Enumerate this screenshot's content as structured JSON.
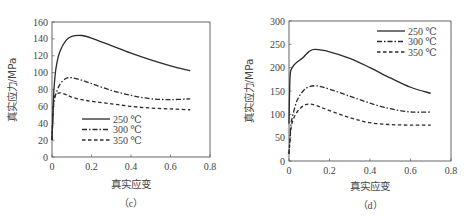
{
  "chart_data": [
    {
      "id": "c",
      "type": "line",
      "caption": "（c）",
      "xlabel": "真实应变",
      "ylabel": "真实应力/MPa",
      "xlim": [
        0,
        0.8
      ],
      "ylim": [
        0,
        160
      ],
      "xticks": [
        "0",
        "0.2",
        "0.4",
        "0.6",
        "0.8"
      ],
      "yticks": [
        "0",
        "20",
        "40",
        "60",
        "80",
        "100",
        "120",
        "140",
        "160"
      ],
      "grid": false,
      "legend_position": "center-left",
      "series": [
        {
          "name": "250 ℃",
          "style": "solid",
          "x": [
            0.0,
            0.005,
            0.01,
            0.02,
            0.04,
            0.07,
            0.1,
            0.15,
            0.2,
            0.3,
            0.4,
            0.5,
            0.6,
            0.7
          ],
          "y": [
            20,
            55,
            80,
            105,
            125,
            138,
            143,
            144,
            141,
            132,
            123,
            115,
            108,
            102
          ]
        },
        {
          "name": "300 ℃",
          "style": "dash-dot",
          "x": [
            0.0,
            0.005,
            0.01,
            0.02,
            0.04,
            0.07,
            0.1,
            0.15,
            0.2,
            0.3,
            0.4,
            0.5,
            0.6,
            0.7
          ],
          "y": [
            20,
            50,
            65,
            75,
            86,
            93,
            94,
            91,
            87,
            79,
            73,
            69,
            68,
            69
          ]
        },
        {
          "name": "350 ℃",
          "style": "dashed",
          "x": [
            0.0,
            0.005,
            0.01,
            0.02,
            0.04,
            0.07,
            0.1,
            0.15,
            0.2,
            0.3,
            0.4,
            0.5,
            0.6,
            0.7
          ],
          "y": [
            20,
            50,
            68,
            74,
            76,
            74,
            71,
            68,
            66,
            63,
            60,
            58,
            57,
            56
          ]
        }
      ]
    },
    {
      "id": "d",
      "type": "line",
      "caption": "（d）",
      "xlabel": "真实应变",
      "ylabel": "真实应力/MPa",
      "xlim": [
        0,
        0.8
      ],
      "ylim": [
        0,
        300
      ],
      "xticks": [
        "0",
        "0.2",
        "0.4",
        "0.6",
        "0.8"
      ],
      "yticks": [
        "0",
        "50",
        "100",
        "150",
        "200",
        "250",
        "300"
      ],
      "grid": false,
      "legend_position": "upper-right",
      "series": [
        {
          "name": "250 ℃",
          "style": "solid",
          "x": [
            0.0,
            0.003,
            0.006,
            0.01,
            0.02,
            0.04,
            0.07,
            0.1,
            0.13,
            0.2,
            0.3,
            0.4,
            0.5,
            0.6,
            0.7
          ],
          "y": [
            80,
            150,
            185,
            195,
            203,
            212,
            222,
            235,
            239,
            234,
            220,
            200,
            178,
            158,
            145
          ]
        },
        {
          "name": "300 ℃",
          "style": "dash-dot",
          "x": [
            0.0,
            0.005,
            0.01,
            0.02,
            0.04,
            0.07,
            0.1,
            0.14,
            0.2,
            0.3,
            0.4,
            0.5,
            0.6,
            0.7
          ],
          "y": [
            15,
            50,
            80,
            100,
            130,
            150,
            159,
            161,
            154,
            139,
            124,
            112,
            105,
            105
          ]
        },
        {
          "name": "350 ℃",
          "style": "dashed",
          "x": [
            0.0,
            0.005,
            0.01,
            0.02,
            0.04,
            0.07,
            0.1,
            0.14,
            0.2,
            0.3,
            0.4,
            0.5,
            0.6,
            0.7
          ],
          "y": [
            15,
            45,
            70,
            88,
            105,
            118,
            122,
            118,
            108,
            93,
            82,
            78,
            77,
            77
          ]
        }
      ]
    }
  ],
  "colors": {
    "line": "#2b2b2b",
    "axis": "#555555",
    "text": "#444444"
  }
}
